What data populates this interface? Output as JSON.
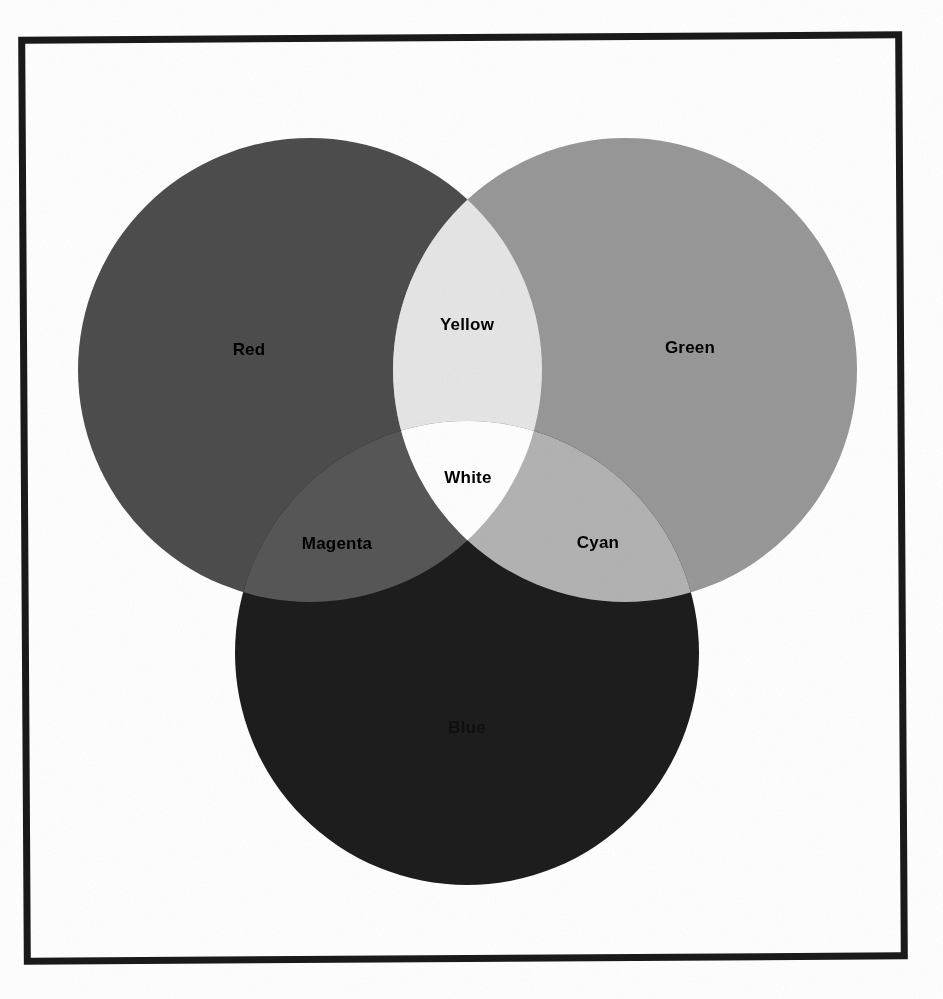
{
  "page": {
    "background": "#ffffff",
    "width": 943,
    "height": 999
  },
  "frame": {
    "name": "image-border",
    "color": "#1a1a1a",
    "thickness": 7,
    "x": 21,
    "y": 34,
    "width": 884,
    "height": 928
  },
  "chart_data": {
    "type": "venn",
    "title": "",
    "subtitle": "",
    "grid": false,
    "legend": "none",
    "axis_ranges": null,
    "circles": [
      {
        "id": "red",
        "label": "Red",
        "cx": 310,
        "cy": 370,
        "r": 232,
        "fill": "#4d4d4d",
        "label_x": 249,
        "label_y": 350
      },
      {
        "id": "green",
        "label": "Green",
        "cx": 625,
        "cy": 370,
        "r": 232,
        "fill": "#989898",
        "label_x": 690,
        "label_y": 348
      },
      {
        "id": "blue",
        "label": "Blue",
        "cx": 467,
        "cy": 653,
        "r": 232,
        "fill": "#1d1d1d",
        "label_x": 467,
        "label_y": 728
      }
    ],
    "intersections": [
      {
        "id": "yellow",
        "label": "Yellow",
        "of": [
          "red",
          "green"
        ],
        "fill": "#e6e6e6",
        "label_x": 467,
        "label_y": 325
      },
      {
        "id": "magenta",
        "label": "Magenta",
        "of": [
          "red",
          "blue"
        ],
        "fill": "#575757",
        "label_x": 337,
        "label_y": 544
      },
      {
        "id": "cyan",
        "label": "Cyan",
        "of": [
          "green",
          "blue"
        ],
        "fill": "#b3b3b3",
        "label_x": 598,
        "label_y": 543
      },
      {
        "id": "white",
        "label": "White",
        "of": [
          "red",
          "green",
          "blue"
        ],
        "fill": "#ffffff",
        "label_x": 468,
        "label_y": 478
      }
    ],
    "categories": [
      "Red",
      "Green",
      "Blue",
      "Yellow",
      "Magenta",
      "Cyan",
      "White"
    ],
    "values": [
      {
        "name": "Red",
        "gray": "#4d4d4d"
      },
      {
        "name": "Green",
        "gray": "#989898"
      },
      {
        "name": "Blue",
        "gray": "#1d1d1d"
      },
      {
        "name": "Yellow",
        "gray": "#e6e6e6"
      },
      {
        "name": "Magenta",
        "gray": "#575757"
      },
      {
        "name": "Cyan",
        "gray": "#b3b3b3"
      },
      {
        "name": "White",
        "gray": "#ffffff"
      }
    ]
  }
}
